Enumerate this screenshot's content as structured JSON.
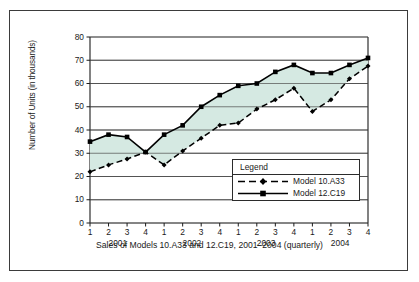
{
  "figure": {
    "caption": "Sales of Models 10.A33 and 12.C19, 2001–2004 (quarterly)",
    "ylabel": "Number of Units (in thousands)",
    "legend_title": "Legend"
  },
  "chart_data": {
    "type": "line",
    "title": "Sales of Models 10.A33 and 12.C19, 2001–2004 (quarterly)",
    "xlabel": "",
    "ylabel": "Number of Units (in thousands)",
    "ylim": [
      0,
      80
    ],
    "yticks": [
      0,
      10,
      20,
      30,
      40,
      50,
      60,
      70,
      80
    ],
    "ytick_labels": [
      "0",
      "10",
      "20",
      "30",
      "40",
      "50",
      "60",
      "70",
      "80"
    ],
    "grid": "horizontal",
    "legend_position": "inside-lower-right",
    "x_quarter_labels": [
      "1",
      "2",
      "3",
      "4",
      "1",
      "2",
      "3",
      "4",
      "1",
      "2",
      "3",
      "4",
      "1",
      "2",
      "3",
      "4"
    ],
    "x_year_labels": [
      "2001",
      "2002",
      "2003",
      "2004"
    ],
    "categories": [
      "2001 Q1",
      "2001 Q2",
      "2001 Q3",
      "2001 Q4",
      "2002 Q1",
      "2002 Q2",
      "2002 Q3",
      "2002 Q4",
      "2003 Q1",
      "2003 Q2",
      "2003 Q3",
      "2003 Q4",
      "2004 Q1",
      "2004 Q2",
      "2004 Q3",
      "2004 Q4"
    ],
    "series": [
      {
        "name": "Model 10.A33",
        "style": "dashed",
        "marker": "diamond",
        "color": "#000000",
        "values": [
          22,
          25,
          27.5,
          30.5,
          25,
          31,
          36.5,
          42,
          43,
          49,
          53,
          58,
          48,
          53,
          62,
          67.5
        ]
      },
      {
        "name": "Model 12.C19",
        "style": "solid",
        "marker": "square",
        "color": "#000000",
        "values": [
          35,
          38,
          37,
          30.5,
          38,
          42,
          50,
          55,
          59,
          60,
          65,
          68,
          64.5,
          64.5,
          68,
          71
        ]
      }
    ],
    "fill_between": {
      "between": [
        "Model 10.A33",
        "Model 12.C19"
      ],
      "color": "#d5e9e2"
    }
  },
  "colors": {
    "frame": "#3b3b3b",
    "axis": "#1a1a1a",
    "grid": "#4a4a4a",
    "fill": "#d5e9e2",
    "line": "#000000"
  }
}
